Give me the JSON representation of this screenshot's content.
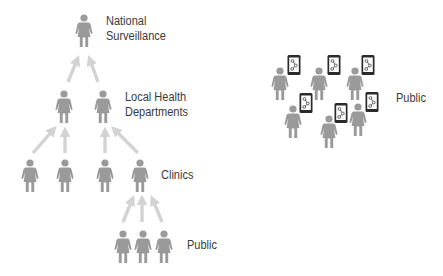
{
  "colors": {
    "person": "#9a9a9a",
    "arrow": "#d3d3d3",
    "phone_frame": "#2a2a2a",
    "phone_screen": "#ffffff",
    "text": "#3a3a3a"
  },
  "hierarchy": {
    "levels": [
      {
        "id": "national",
        "label_line1": "National",
        "label_line2": "Surveillance",
        "count": 1
      },
      {
        "id": "local",
        "label_line1": "Local Health",
        "label_line2": "Departments",
        "count": 2
      },
      {
        "id": "clinics",
        "label": "Clinics",
        "count": 4
      },
      {
        "id": "public",
        "label": "Public",
        "count": 3
      }
    ]
  },
  "crowd": {
    "label": "Public",
    "people_count": 7,
    "phone_icon": "smartphone-share-icon"
  }
}
